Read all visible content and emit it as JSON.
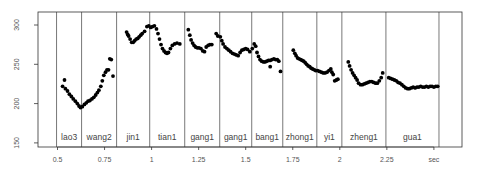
{
  "chart_data": {
    "type": "scatter",
    "title": "",
    "xlabel": "sec",
    "ylabel": "",
    "xlim": [
      0.4,
      2.6
    ],
    "ylim": [
      145,
      310
    ],
    "grid": false,
    "x_ticks": [
      {
        "value": 0.5,
        "label": "0.5"
      },
      {
        "value": 0.75,
        "label": "0.75"
      },
      {
        "value": 1.0,
        "label": "1"
      },
      {
        "value": 1.25,
        "label": "1.25"
      },
      {
        "value": 1.5,
        "label": "1.5"
      },
      {
        "value": 1.75,
        "label": "1.75"
      },
      {
        "value": 2.0,
        "label": "2"
      },
      {
        "value": 2.25,
        "label": "2.25"
      },
      {
        "value": 2.5,
        "label": "sec"
      }
    ],
    "y_ticks": [
      {
        "value": 150,
        "label": "150"
      },
      {
        "value": 200,
        "label": "200"
      },
      {
        "value": 250,
        "label": "250"
      },
      {
        "value": 300,
        "label": "300"
      }
    ],
    "boundaries": [
      0.495,
      0.628,
      0.814,
      0.99,
      1.176,
      1.362,
      1.532,
      1.697,
      1.878,
      2.011,
      2.245,
      2.527
    ],
    "segments": [
      {
        "label": "lao3",
        "start": 0.495,
        "end": 0.628
      },
      {
        "label": "wang2",
        "start": 0.628,
        "end": 0.814
      },
      {
        "label": "jin1",
        "start": 0.814,
        "end": 0.99
      },
      {
        "label": "tian1",
        "start": 0.99,
        "end": 1.176
      },
      {
        "label": "gang1",
        "start": 1.176,
        "end": 1.362
      },
      {
        "label": "gang1",
        "start": 1.362,
        "end": 1.532
      },
      {
        "label": "bang1",
        "start": 1.532,
        "end": 1.697
      },
      {
        "label": "zhong1",
        "start": 1.697,
        "end": 1.878
      },
      {
        "label": "yi1",
        "start": 1.878,
        "end": 2.011
      },
      {
        "label": "zheng1",
        "start": 2.011,
        "end": 2.245
      },
      {
        "label": "gua1",
        "start": 2.245,
        "end": 2.527
      }
    ],
    "series": [
      {
        "name": "F0 (Hz)",
        "points": [
          [
            0.527,
            222
          ],
          [
            0.537,
            230
          ],
          [
            0.542,
            219
          ],
          [
            0.553,
            216
          ],
          [
            0.563,
            212
          ],
          [
            0.574,
            209
          ],
          [
            0.584,
            206
          ],
          [
            0.595,
            203
          ],
          [
            0.605,
            200
          ],
          [
            0.614,
            197
          ],
          [
            0.622,
            195
          ],
          [
            0.632,
            196
          ],
          [
            0.643,
            199
          ],
          [
            0.653,
            201
          ],
          [
            0.662,
            203
          ],
          [
            0.672,
            204
          ],
          [
            0.683,
            206
          ],
          [
            0.693,
            208
          ],
          [
            0.703,
            211
          ],
          [
            0.712,
            214
          ],
          [
            0.72,
            217
          ],
          [
            0.73,
            222
          ],
          [
            0.738,
            229
          ],
          [
            0.746,
            236
          ],
          [
            0.755,
            240
          ],
          [
            0.763,
            243
          ],
          [
            0.771,
            243
          ],
          [
            0.778,
            257
          ],
          [
            0.786,
            256
          ],
          [
            0.795,
            235
          ],
          [
            0.867,
            291
          ],
          [
            0.873,
            288
          ],
          [
            0.878,
            286
          ],
          [
            0.886,
            282
          ],
          [
            0.894,
            278
          ],
          [
            0.902,
            278
          ],
          [
            0.91,
            280
          ],
          [
            0.918,
            282
          ],
          [
            0.926,
            283
          ],
          [
            0.934,
            285
          ],
          [
            0.942,
            287
          ],
          [
            0.95,
            289
          ],
          [
            0.963,
            292
          ],
          [
            0.975,
            298
          ],
          [
            0.985,
            299
          ],
          [
            0.995,
            297
          ],
          [
            1.005,
            298
          ],
          [
            1.015,
            299
          ],
          [
            1.026,
            295
          ],
          [
            1.034,
            289
          ],
          [
            1.042,
            282
          ],
          [
            1.05,
            275
          ],
          [
            1.058,
            270
          ],
          [
            1.066,
            267
          ],
          [
            1.074,
            265
          ],
          [
            1.082,
            264
          ],
          [
            1.09,
            265
          ],
          [
            1.1,
            270
          ],
          [
            1.11,
            274
          ],
          [
            1.122,
            276
          ],
          [
            1.135,
            277
          ],
          [
            1.15,
            276
          ],
          [
            1.195,
            294
          ],
          [
            1.203,
            287
          ],
          [
            1.21,
            281
          ],
          [
            1.218,
            277
          ],
          [
            1.226,
            274
          ],
          [
            1.234,
            272
          ],
          [
            1.243,
            271
          ],
          [
            1.252,
            271
          ],
          [
            1.262,
            270
          ],
          [
            1.272,
            267
          ],
          [
            1.281,
            266
          ],
          [
            1.29,
            272
          ],
          [
            1.3,
            274
          ],
          [
            1.31,
            275
          ],
          [
            1.32,
            275
          ],
          [
            1.343,
            289
          ],
          [
            1.352,
            286
          ],
          [
            1.365,
            285
          ],
          [
            1.373,
            280
          ],
          [
            1.38,
            276
          ],
          [
            1.39,
            272
          ],
          [
            1.4,
            270
          ],
          [
            1.41,
            268
          ],
          [
            1.42,
            266
          ],
          [
            1.43,
            264
          ],
          [
            1.44,
            263
          ],
          [
            1.45,
            262
          ],
          [
            1.46,
            261
          ],
          [
            1.47,
            265
          ],
          [
            1.48,
            268
          ],
          [
            1.49,
            269
          ],
          [
            1.5,
            270
          ],
          [
            1.51,
            269
          ],
          [
            1.522,
            266
          ],
          [
            1.535,
            270
          ],
          [
            1.545,
            276
          ],
          [
            1.553,
            273
          ],
          [
            1.56,
            265
          ],
          [
            1.568,
            260
          ],
          [
            1.576,
            256
          ],
          [
            1.585,
            254
          ],
          [
            1.594,
            253
          ],
          [
            1.603,
            253
          ],
          [
            1.612,
            254
          ],
          [
            1.621,
            255
          ],
          [
            1.63,
            255
          ],
          [
            1.64,
            256
          ],
          [
            1.65,
            257
          ],
          [
            1.659,
            256
          ],
          [
            1.668,
            256
          ],
          [
            1.63,
            247
          ],
          [
            1.676,
            254
          ],
          [
            1.685,
            241
          ],
          [
            1.753,
            268
          ],
          [
            1.761,
            264
          ],
          [
            1.768,
            261
          ],
          [
            1.776,
            258
          ],
          [
            1.784,
            257
          ],
          [
            1.792,
            256
          ],
          [
            1.8,
            255
          ],
          [
            1.808,
            254
          ],
          [
            1.816,
            252
          ],
          [
            1.824,
            250
          ],
          [
            1.832,
            248
          ],
          [
            1.84,
            247
          ],
          [
            1.848,
            245
          ],
          [
            1.856,
            244
          ],
          [
            1.865,
            243
          ],
          [
            1.872,
            242
          ],
          [
            1.882,
            242
          ],
          [
            1.892,
            241
          ],
          [
            1.902,
            240
          ],
          [
            1.912,
            239
          ],
          [
            1.922,
            239
          ],
          [
            1.932,
            240
          ],
          [
            1.942,
            242
          ],
          [
            1.952,
            244
          ],
          [
            1.958,
            240
          ],
          [
            1.965,
            237
          ],
          [
            1.973,
            229
          ],
          [
            1.982,
            230
          ],
          [
            1.99,
            231
          ],
          [
            2.045,
            253
          ],
          [
            2.052,
            248
          ],
          [
            2.06,
            243
          ],
          [
            2.068,
            239
          ],
          [
            2.076,
            236
          ],
          [
            2.084,
            233
          ],
          [
            2.092,
            230
          ],
          [
            2.1,
            226
          ],
          [
            2.11,
            224
          ],
          [
            2.12,
            224
          ],
          [
            2.13,
            225
          ],
          [
            2.14,
            226
          ],
          [
            2.15,
            227
          ],
          [
            2.16,
            228
          ],
          [
            2.17,
            228
          ],
          [
            2.18,
            227
          ],
          [
            2.19,
            226
          ],
          [
            2.2,
            226
          ],
          [
            2.21,
            229
          ],
          [
            2.22,
            233
          ],
          [
            2.228,
            239
          ],
          [
            2.26,
            233
          ],
          [
            2.27,
            232
          ],
          [
            2.28,
            231
          ],
          [
            2.29,
            230
          ],
          [
            2.3,
            229
          ],
          [
            2.31,
            227
          ],
          [
            2.32,
            226
          ],
          [
            2.33,
            224
          ],
          [
            2.34,
            222
          ],
          [
            2.35,
            220
          ],
          [
            2.36,
            219
          ],
          [
            2.37,
            219
          ],
          [
            2.38,
            220
          ],
          [
            2.39,
            221
          ],
          [
            2.4,
            220
          ],
          [
            2.41,
            221
          ],
          [
            2.42,
            221
          ],
          [
            2.43,
            222
          ],
          [
            2.44,
            221
          ],
          [
            2.45,
            221
          ],
          [
            2.46,
            222
          ],
          [
            2.47,
            221
          ],
          [
            2.48,
            222
          ],
          [
            2.49,
            222
          ],
          [
            2.5,
            221
          ],
          [
            2.51,
            222
          ],
          [
            2.52,
            222
          ]
        ]
      }
    ]
  },
  "layout": {
    "plot_left": 38,
    "plot_right": 462,
    "plot_top": 12,
    "plot_bottom": 147,
    "x0_value": 0.5,
    "x0_px": 57.5,
    "px_per_sec": 188.2,
    "y0_value": 300,
    "y0_px": 25,
    "px_per_hz": 0.786,
    "colors": {
      "frame": "#333333",
      "boundary": "#555555",
      "points": "#000000",
      "text": "#555555"
    }
  }
}
